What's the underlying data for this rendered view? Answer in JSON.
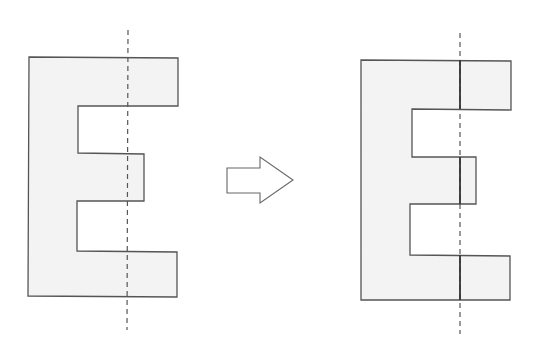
{
  "diagram": {
    "colors": {
      "fill": "#f3f3f3",
      "stroke": "#555555",
      "dash": "#555555",
      "background": "#ffffff"
    },
    "left_shape": {
      "label": "E shape with vertical dashed line",
      "points": "29,57 178,58 178,106 78,106 78,153 144,154 144,201 77,201 77,251 177,252 177,297 28,296",
      "axis": {
        "x1": 128,
        "y1": 30,
        "x2": 127,
        "y2": 330
      }
    },
    "arrow": {
      "label": "right-arrow",
      "points": "227,168 260,168 260,157 293,180 260,203 260,193 227,193"
    },
    "right_shape": {
      "label": "E shape with solid cut lines along axis",
      "points": "361,60 511,61 511,110 412,109 412,157 476,157 476,204 410,204 410,255 510,256 510,300 361,300",
      "axis": {
        "x1": 460,
        "y1": 33,
        "x2": 460,
        "y2": 334
      },
      "cut_segments": [
        {
          "y1": 60,
          "y2": 109
        },
        {
          "y1": 157,
          "y2": 204
        },
        {
          "y1": 255,
          "y2": 300
        }
      ]
    }
  }
}
